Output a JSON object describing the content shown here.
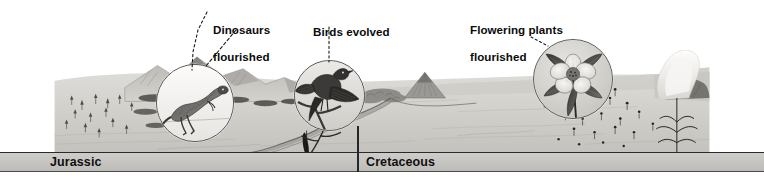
{
  "figure": {
    "title": "Mesozoic timeline illustration",
    "style": "grayscale pen-and-ink landscape panorama"
  },
  "timeline": {
    "periods": [
      {
        "id": "jurassic",
        "label": "Jurassic"
      },
      {
        "id": "cretaceous",
        "label": "Cretaceous"
      }
    ]
  },
  "callouts": [
    {
      "id": "dinosaurs",
      "label": "Dinosaurs\nflourished",
      "line1": "Dinosaurs",
      "line2": "flourished",
      "inset_subject": "theropod-dinosaur"
    },
    {
      "id": "birds",
      "label": "Birds evolved",
      "line1": "Birds evolved",
      "line2": "",
      "inset_subject": "archaeopteryx-bird"
    },
    {
      "id": "flowering-plants",
      "label": "Flowering plants\nflourished",
      "line1": "Flowering plants",
      "line2": "flourished",
      "inset_subject": "flower-blossom"
    }
  ],
  "scene": {
    "left_region": "mountain range with scattered conifers and cycads",
    "middle_region": "plain with small volcano and winding river",
    "right_region": "meadow scattered with small flowers and an erupting volcano"
  },
  "colors": {
    "band_fill": "#c6c4c0",
    "band_border": "#2b2b2b",
    "ink": "#0b0b0b",
    "ground_light": "#d9d7d3",
    "ground_mid": "#c3c1bc",
    "sky": "#ffffff"
  }
}
